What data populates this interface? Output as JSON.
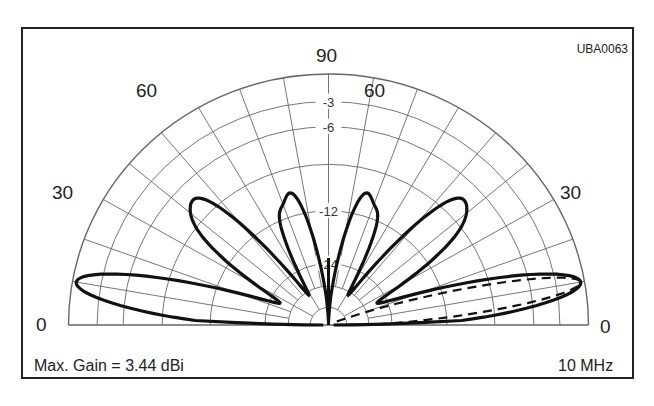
{
  "chart_data": {
    "type": "polar",
    "figure_id": "UBA0063",
    "frequency": "10 MHz",
    "max_gain_label": "Max. Gain = 3.44 dBi",
    "angle_labels": {
      "left": [
        "0",
        "30",
        "60"
      ],
      "top": "90",
      "right": [
        "60",
        "30",
        "0"
      ]
    },
    "ring_labels": [
      "-3",
      "-6",
      "-12",
      "-24"
    ],
    "angle_grid_deg": [
      0,
      10,
      20,
      30,
      40,
      50,
      60,
      70,
      80,
      90
    ],
    "series": [
      {
        "name": "main pattern (solid)",
        "style": "solid",
        "lobes": [
          {
            "peak_elevation_deg": 10,
            "peak_gain_db": 0
          },
          {
            "peak_elevation_deg": 40,
            "peak_gain_db": -10
          },
          {
            "peak_elevation_deg": 75,
            "peak_gain_db": -11
          }
        ]
      },
      {
        "name": "comparison pattern (dashed)",
        "style": "dashed",
        "lobes": [
          {
            "peak_elevation_deg": 10,
            "peak_gain_db": 0
          }
        ]
      }
    ]
  },
  "labels": {
    "code": "UBA0063",
    "top": "90",
    "left60": "60",
    "right60": "60",
    "left30": "30",
    "right30": "30",
    "left0": "0",
    "right0": "0",
    "r3": "-3",
    "r6": "-6",
    "r12": "-12",
    "r24": "-24",
    "gain": "Max. Gain = 3.44 dBi",
    "freq": "10 MHz"
  }
}
